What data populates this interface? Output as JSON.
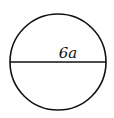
{
  "diagram": {
    "shape": "circle",
    "diameter_label": "6a",
    "stroke_color": "#111111",
    "background": "#ffffff"
  }
}
